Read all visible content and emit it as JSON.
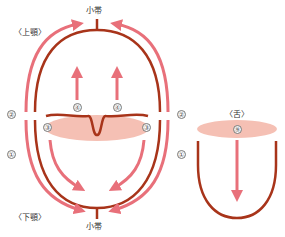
{
  "labels": {
    "frenulum_top": "小帯",
    "frenulum_bottom": "小帯",
    "upper_jaw": "〈上顎〉",
    "lower_jaw": "〈下顎〉",
    "tongue": "〈舌〉"
  },
  "markers": {
    "m1_left": "①",
    "m1_right": "①",
    "m2_left": "②",
    "m2_right": "②",
    "m3_left": "③",
    "m3_right": "③",
    "m4_left": "④",
    "m4_right": "④",
    "m9": "⑨"
  },
  "colors": {
    "outline": "#a8341a",
    "arrow": "#e8707a",
    "fill": "#f5c0b4"
  }
}
